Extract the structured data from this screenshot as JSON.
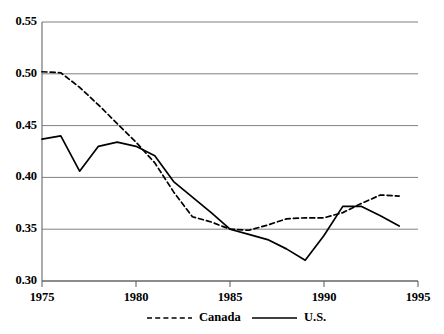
{
  "chart_data": {
    "type": "line",
    "title": "",
    "subtitle": "",
    "xlabel": "",
    "ylabel": "",
    "xlim": [
      1975,
      1995
    ],
    "ylim": [
      0.3,
      0.55
    ],
    "grid": "horizontal",
    "legend_position": "bottom",
    "x_ticks": [
      "1975",
      "1980",
      "1985",
      "1990",
      "1995"
    ],
    "x_tick_values": [
      1975,
      1980,
      1985,
      1990,
      1995
    ],
    "y_ticks": [
      "0.30",
      "0.35",
      "0.40",
      "0.45",
      "0.50",
      "0.55"
    ],
    "y_tick_values": [
      0.3,
      0.35,
      0.4,
      0.45,
      0.5,
      0.55
    ],
    "series": [
      {
        "name": "Canada",
        "style": "dashed",
        "color": "#000000",
        "x": [
          1975,
          1976,
          1977,
          1978,
          1979,
          1980,
          1981,
          1982,
          1983,
          1984,
          1985,
          1986,
          1987,
          1988,
          1989,
          1990,
          1991,
          1992,
          1993,
          1994
        ],
        "values": [
          0.502,
          0.501,
          0.487,
          0.47,
          0.452,
          0.434,
          0.414,
          0.386,
          0.362,
          0.357,
          0.35,
          0.349,
          0.354,
          0.36,
          0.361,
          0.361,
          0.366,
          0.375,
          0.383,
          0.382
        ]
      },
      {
        "name": "U.S.",
        "style": "solid",
        "color": "#000000",
        "x": [
          1975,
          1976,
          1977,
          1978,
          1979,
          1980,
          1981,
          1982,
          1983,
          1984,
          1985,
          1986,
          1987,
          1988,
          1989,
          1990,
          1991,
          1992,
          1993,
          1994
        ],
        "values": [
          0.437,
          0.44,
          0.406,
          0.43,
          0.434,
          0.43,
          0.421,
          0.396,
          0.381,
          0.366,
          0.35,
          0.345,
          0.34,
          0.331,
          0.32,
          0.344,
          0.372,
          0.372,
          0.363,
          0.353
        ]
      }
    ],
    "legend": [
      {
        "label": "Canada",
        "style": "dashed"
      },
      {
        "label": "U.S.",
        "style": "solid"
      }
    ]
  },
  "axes": {
    "gridline_color": "#808080",
    "axis_color": "#595959",
    "plot_left": 42,
    "plot_right": 418,
    "plot_top": 22,
    "plot_bottom": 281
  }
}
